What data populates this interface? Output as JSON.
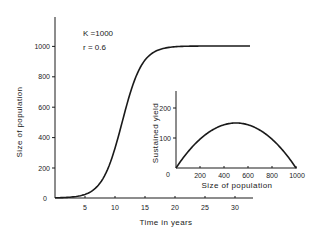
{
  "chart_data": [
    {
      "id": "main",
      "type": "line",
      "title": "",
      "xlabel": "Time in years",
      "ylabel": "Size of population",
      "xlim": [
        0,
        33
      ],
      "ylim": [
        0,
        1150
      ],
      "x_ticks": [
        5,
        10,
        15,
        20,
        25,
        30
      ],
      "y_ticks": [
        0,
        200,
        400,
        600,
        800,
        1000
      ],
      "x_tick_labels": [
        "5",
        "10",
        "15",
        "20",
        "25",
        "30"
      ],
      "y_tick_labels": [
        "0",
        "200",
        "400",
        "600",
        "800",
        "1000"
      ],
      "grid": false,
      "annotations": [
        "K =1000",
        "r = 0.6"
      ],
      "model": "logistic",
      "params": {
        "K": 1000,
        "r": 0.6,
        "t_mid": 11.2
      },
      "series": [
        {
          "name": "Logistic population growth",
          "x": [
            0,
            2,
            4,
            5,
            6,
            7,
            8,
            9,
            10,
            11,
            12,
            13,
            14,
            15,
            16,
            18,
            20,
            25,
            30,
            32.5
          ],
          "values": [
            1,
            4,
            14,
            25,
            45,
            79,
            135,
            216,
            327,
            470,
            618,
            746,
            843,
            908,
            947,
            985,
            995,
            999,
            1000,
            1000
          ]
        }
      ]
    },
    {
      "id": "inset",
      "type": "line",
      "title": "",
      "xlabel": "Size of population",
      "ylabel": "Sustained  yield",
      "xlim": [
        0,
        1000
      ],
      "ylim": [
        0,
        250
      ],
      "x_ticks": [
        200,
        400,
        600,
        800,
        1000
      ],
      "y_ticks": [
        0,
        100,
        200
      ],
      "x_tick_labels": [
        "200",
        "400",
        "600",
        "800",
        "1000"
      ],
      "y_tick_labels": [
        "0",
        "100",
        "200"
      ],
      "grid": false,
      "model": "yield = r·N·(1 − N/K)",
      "series": [
        {
          "name": "Sustained yield",
          "x": [
            0,
            100,
            200,
            300,
            400,
            500,
            600,
            700,
            800,
            900,
            1000
          ],
          "values": [
            0,
            54,
            96,
            126,
            144,
            150,
            144,
            126,
            96,
            54,
            0
          ]
        }
      ]
    }
  ],
  "labels": {
    "main_x": "Time in years",
    "main_y": "Size of population",
    "inset_x": "Size of population",
    "inset_y": "Sustained  yield",
    "k_annotation": "K =1000",
    "r_annotation": "r = 0.6",
    "main_x_ticks": [
      "5",
      "10",
      "15",
      "20",
      "25",
      "30"
    ],
    "main_y_ticks": [
      "0",
      "200",
      "400",
      "600",
      "800",
      "1000"
    ],
    "inset_x_ticks": [
      "200",
      "400",
      "600",
      "800",
      "1000"
    ],
    "inset_y_ticks": [
      "0",
      "100",
      "200"
    ]
  }
}
